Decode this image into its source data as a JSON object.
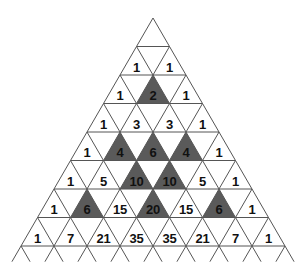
{
  "diagram": {
    "apex": {
      "x": 153,
      "y": 18
    },
    "row_height": 28.5,
    "half_width": 16.5,
    "line_color": "#555555",
    "shade_color": "#5a5a5a",
    "rows": [
      {
        "row": 1,
        "values": [
          "1",
          "1"
        ],
        "shaded": [
          false,
          false
        ]
      },
      {
        "row": 2,
        "values": [
          "1",
          "2",
          "1"
        ],
        "shaded": [
          false,
          true,
          false
        ]
      },
      {
        "row": 3,
        "values": [
          "1",
          "3",
          "3",
          "1"
        ],
        "shaded": [
          false,
          false,
          false,
          false
        ]
      },
      {
        "row": 4,
        "values": [
          "1",
          "4",
          "6",
          "4",
          "1"
        ],
        "shaded": [
          false,
          true,
          true,
          true,
          false
        ]
      },
      {
        "row": 5,
        "values": [
          "1",
          "5",
          "10",
          "10",
          "5",
          "1"
        ],
        "shaded": [
          false,
          false,
          true,
          true,
          false,
          false
        ]
      },
      {
        "row": 6,
        "values": [
          "1",
          "6",
          "15",
          "20",
          "15",
          "6",
          "1"
        ],
        "shaded": [
          false,
          true,
          false,
          true,
          false,
          true,
          false
        ]
      },
      {
        "row": 7,
        "values": [
          "1",
          "7",
          "21",
          "35",
          "35",
          "21",
          "7",
          "1"
        ],
        "shaded": [
          false,
          false,
          false,
          false,
          false,
          false,
          false,
          false
        ]
      }
    ]
  }
}
